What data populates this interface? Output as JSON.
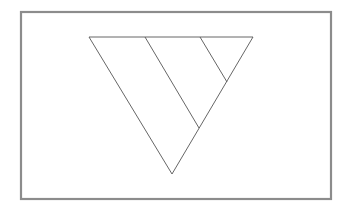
{
  "diagram": {
    "frame": {
      "x": 21,
      "y": 12,
      "width": 310,
      "height": 187,
      "stroke": "#8c8c8c",
      "stroke_width": 2.2
    },
    "triangle": {
      "points": [
        [
          89,
          37
        ],
        [
          253,
          37
        ],
        [
          172,
          174
        ]
      ],
      "stroke": "#555555",
      "stroke_width": 0.9
    },
    "dividers": [
      {
        "x1": 145,
        "y1": 37,
        "x2": 199,
        "y2": 128
      },
      {
        "x1": 200,
        "y1": 37,
        "x2": 227,
        "y2": 82
      }
    ],
    "line_color": "#555555",
    "background": "#ffffff"
  }
}
